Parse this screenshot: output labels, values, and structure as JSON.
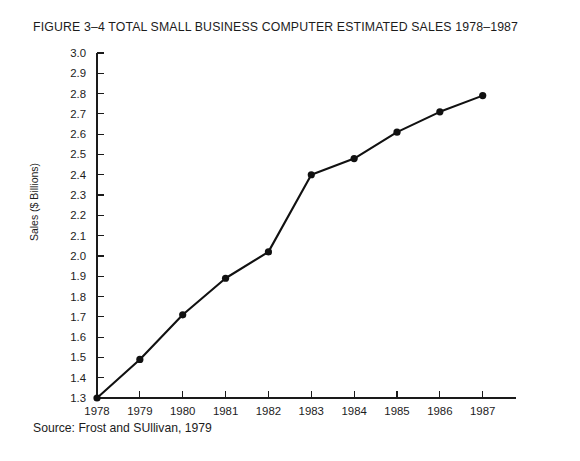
{
  "figure": {
    "title": "FIGURE 3–4  TOTAL SMALL BUSINESS COMPUTER ESTIMATED SALES 1978–1987",
    "source": "Source: Frost and SUllivan, 1979"
  },
  "chart_data": {
    "type": "line",
    "title": "FIGURE 3–4  TOTAL SMALL BUSINESS COMPUTER ESTIMATED SALES 1978–1987",
    "xlabel": "",
    "ylabel": "Sales ($ Billions)",
    "x": [
      1978,
      1979,
      1980,
      1981,
      1982,
      1983,
      1984,
      1985,
      1986,
      1987
    ],
    "values": [
      1.3,
      1.49,
      1.71,
      1.89,
      2.02,
      2.4,
      2.48,
      2.61,
      2.71,
      2.79
    ],
    "series": [
      {
        "name": "Total small business computer estimated sales",
        "values": [
          1.3,
          1.49,
          1.71,
          1.89,
          2.02,
          2.4,
          2.48,
          2.61,
          2.71,
          2.79
        ]
      }
    ],
    "xlim": [
      1978,
      1987.45
    ],
    "ylim": [
      1.3,
      3.0
    ],
    "ytick_labels": [
      "3.0",
      "2.9",
      "2.8",
      "2.7",
      "2.6",
      "2.5",
      "2.4",
      "2.3",
      "2.2",
      "2.1",
      "2.0",
      "1.9",
      "1.8",
      "1.7",
      "1.6",
      "1.5",
      "1.4",
      "1.3"
    ],
    "ytick_values": [
      3.0,
      2.9,
      2.8,
      2.7,
      2.6,
      2.5,
      2.4,
      2.3,
      2.2,
      2.1,
      2.0,
      1.9,
      1.8,
      1.7,
      1.6,
      1.5,
      1.4,
      1.3
    ],
    "xtick_labels": [
      "1978",
      "1979",
      "1980",
      "1981",
      "1982",
      "1983",
      "1984",
      "1985",
      "1986",
      "1987"
    ],
    "xtick_values": [
      1978,
      1979,
      1980,
      1981,
      1982,
      1983,
      1984,
      1985,
      1986,
      1987
    ],
    "grid": false,
    "legend": false,
    "marker": "filled-circle",
    "line_color": "#111111",
    "annotations": [
      "Source: Frost and SUllivan, 1979"
    ]
  }
}
